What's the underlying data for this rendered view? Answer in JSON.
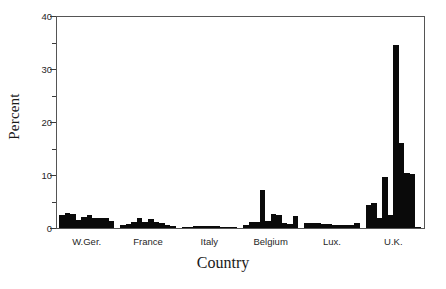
{
  "chart_data": {
    "type": "bar",
    "title": "",
    "xlabel": "Country",
    "ylabel": "Percent",
    "ylim": [
      0,
      40
    ],
    "yticks": [
      0,
      10,
      20,
      30,
      40
    ],
    "yticks_minor": [
      5,
      15,
      25,
      35
    ],
    "grid": false,
    "legend": null,
    "categories": [
      "W.Ger.",
      "France",
      "Italy",
      "Belgium",
      "Lux.",
      "U.K."
    ],
    "series": [
      {
        "name": "Percent",
        "groups": [
          {
            "category": "W.Ger.",
            "values": [
              2.4,
              2.8,
              2.6,
              1.6,
              2.0,
              2.4,
              1.8,
              1.9,
              1.8,
              1.4
            ]
          },
          {
            "category": "France",
            "values": [
              0.6,
              0.7,
              1.2,
              1.8,
              1.2,
              1.7,
              1.1,
              1.0,
              0.6,
              0.4
            ]
          },
          {
            "category": "Italy",
            "values": [
              0.2,
              0.2,
              0.3,
              0.3,
              0.4,
              0.3,
              0.3,
              0.2,
              0.2,
              0.2
            ]
          },
          {
            "category": "Belgium",
            "values": [
              0.5,
              1.1,
              1.2,
              7.2,
              1.3,
              2.7,
              2.5,
              0.9,
              0.7,
              2.3
            ]
          },
          {
            "category": "Lux.",
            "values": [
              0.9,
              1.0,
              0.9,
              0.7,
              0.7,
              0.6,
              0.6,
              0.5,
              0.6,
              0.9
            ]
          },
          {
            "category": "U.K.",
            "values": [
              4.3,
              4.8,
              1.8,
              9.7,
              2.5,
              34.5,
              16.0,
              10.3,
              10.2,
              0.2
            ]
          }
        ]
      }
    ]
  },
  "axes": {
    "y_tick_labels": [
      "0",
      "10",
      "20",
      "30",
      "40"
    ],
    "x_group_labels": [
      "W.Ger.",
      "France",
      "Italy",
      "Belgium",
      "Lux.",
      "U.K."
    ],
    "y_axis_title": "Percent",
    "x_axis_title": "Country"
  },
  "style": {
    "bar_color": "#0a0a0a",
    "frame_color": "#555555",
    "text_color": "#1a1a1a",
    "background": "#ffffff"
  }
}
